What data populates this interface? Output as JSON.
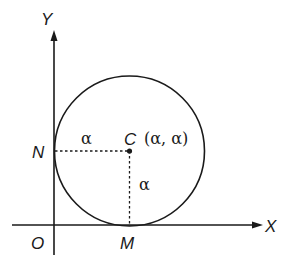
{
  "diagram": {
    "axes": {
      "x_label": "X",
      "y_label": "Y",
      "origin_label": "O"
    },
    "points": {
      "center_label": "C",
      "center_coords": "(α, α)",
      "tangent_y_label": "N",
      "tangent_x_label": "M"
    },
    "segments": {
      "horizontal_radius_label": "α",
      "vertical_radius_label": "α"
    },
    "colors": {
      "stroke": "#1a1a1a",
      "background": "#ffffff"
    }
  }
}
